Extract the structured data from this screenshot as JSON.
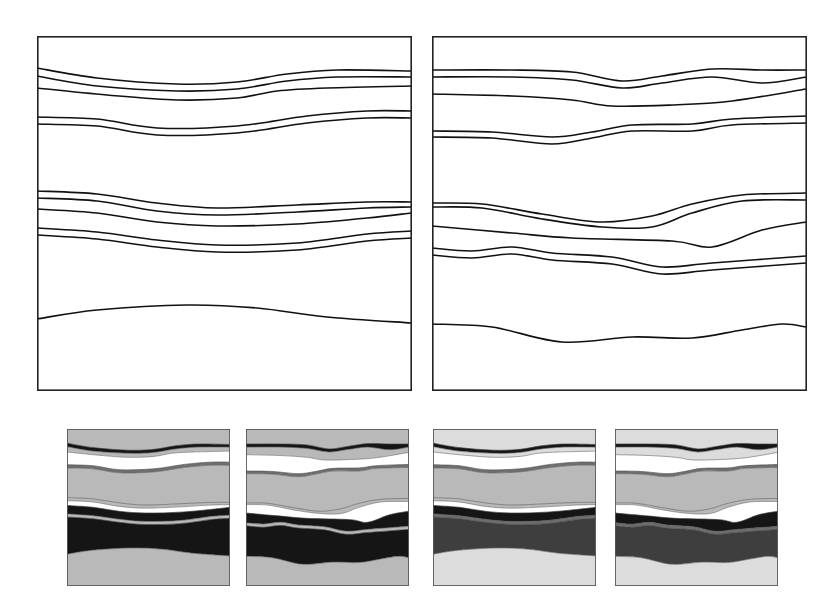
{
  "figure": {
    "colors": {
      "line": "#111111",
      "frame": "#222222",
      "white": "#ffffff",
      "black": "#151515",
      "dark_gray": "#3e3e3e",
      "mid_gray": "#6e6e6e",
      "gray": "#8a8a8a",
      "light_gray": "#b9b9b9",
      "pale_gray": "#dcdcdc"
    },
    "large_panels": [
      {
        "id": "left",
        "width": 374,
        "height": 354,
        "horizons": [
          [
            [
              0,
              32
            ],
            [
              60,
              42
            ],
            [
              140,
              48
            ],
            [
              200,
              46
            ],
            [
              250,
              38
            ],
            [
              300,
              34
            ],
            [
              374,
              35
            ]
          ],
          [
            [
              0,
              40
            ],
            [
              60,
              50
            ],
            [
              140,
              55
            ],
            [
              200,
              53
            ],
            [
              250,
              45
            ],
            [
              300,
              41
            ],
            [
              374,
              41
            ]
          ],
          [
            [
              0,
              52
            ],
            [
              70,
              59
            ],
            [
              140,
              64
            ],
            [
              200,
              62
            ],
            [
              240,
              55
            ],
            [
              290,
              52
            ],
            [
              374,
              50
            ]
          ],
          [
            [
              0,
              81
            ],
            [
              60,
              83
            ],
            [
              120,
              92
            ],
            [
              200,
              90
            ],
            [
              270,
              80
            ],
            [
              330,
              75
            ],
            [
              374,
              75
            ]
          ],
          [
            [
              0,
              88
            ],
            [
              60,
              90
            ],
            [
              120,
              99
            ],
            [
              200,
              97
            ],
            [
              270,
              87
            ],
            [
              330,
              82
            ],
            [
              374,
              82
            ]
          ],
          [
            [
              0,
              155
            ],
            [
              60,
              158
            ],
            [
              120,
              167
            ],
            [
              180,
              172
            ],
            [
              260,
              169
            ],
            [
              330,
              166
            ],
            [
              374,
              166
            ]
          ],
          [
            [
              0,
              162
            ],
            [
              60,
              165
            ],
            [
              120,
              175
            ],
            [
              180,
              179
            ],
            [
              260,
              176
            ],
            [
              330,
              172
            ],
            [
              374,
              171
            ]
          ],
          [
            [
              0,
              173
            ],
            [
              60,
              177
            ],
            [
              120,
              186
            ],
            [
              180,
              190
            ],
            [
              260,
              188
            ],
            [
              330,
              182
            ],
            [
              374,
              177
            ]
          ],
          [
            [
              0,
              192
            ],
            [
              60,
              196
            ],
            [
              120,
              204
            ],
            [
              180,
              209
            ],
            [
              260,
              207
            ],
            [
              330,
              198
            ],
            [
              374,
              195
            ]
          ],
          [
            [
              0,
              199
            ],
            [
              60,
              203
            ],
            [
              120,
              211
            ],
            [
              180,
              216
            ],
            [
              260,
              214
            ],
            [
              330,
              205
            ],
            [
              374,
              202
            ]
          ],
          [
            [
              0,
              283
            ],
            [
              60,
              274
            ],
            [
              150,
              269
            ],
            [
              220,
              272
            ],
            [
              290,
              281
            ],
            [
              374,
              287
            ]
          ]
        ]
      },
      {
        "id": "right",
        "width": 374,
        "height": 354,
        "horizons": [
          [
            [
              0,
              34
            ],
            [
              80,
              34
            ],
            [
              140,
              36
            ],
            [
              190,
              45
            ],
            [
              230,
              40
            ],
            [
              280,
              33
            ],
            [
              330,
              34
            ],
            [
              374,
              34
            ]
          ],
          [
            [
              0,
              41
            ],
            [
              80,
              41
            ],
            [
              140,
              44
            ],
            [
              190,
              52
            ],
            [
              230,
              47
            ],
            [
              280,
              41
            ],
            [
              330,
              47
            ],
            [
              374,
              41
            ]
          ],
          [
            [
              0,
              58
            ],
            [
              80,
              60
            ],
            [
              140,
              64
            ],
            [
              180,
              70
            ],
            [
              240,
              69
            ],
            [
              300,
              65
            ],
            [
              374,
              53
            ]
          ],
          [
            [
              0,
              95
            ],
            [
              60,
              96
            ],
            [
              120,
              101
            ],
            [
              160,
              96
            ],
            [
              200,
              89
            ],
            [
              260,
              88
            ],
            [
              300,
              83
            ],
            [
              374,
              80
            ]
          ],
          [
            [
              0,
              101
            ],
            [
              60,
              102
            ],
            [
              120,
              108
            ],
            [
              160,
              102
            ],
            [
              200,
              95
            ],
            [
              260,
              95
            ],
            [
              300,
              89
            ],
            [
              374,
              87
            ]
          ],
          [
            [
              0,
              167
            ],
            [
              50,
              168
            ],
            [
              110,
              178
            ],
            [
              170,
              186
            ],
            [
              220,
              180
            ],
            [
              260,
              168
            ],
            [
              310,
              159
            ],
            [
              374,
              157
            ]
          ],
          [
            [
              0,
              171
            ],
            [
              50,
              172
            ],
            [
              110,
              183
            ],
            [
              170,
              191
            ],
            [
              220,
              191
            ],
            [
              260,
              177
            ],
            [
              310,
              165
            ],
            [
              374,
              164
            ]
          ],
          [
            [
              0,
              190
            ],
            [
              80,
              197
            ],
            [
              140,
              202
            ],
            [
              240,
              205
            ],
            [
              280,
              211
            ],
            [
              330,
              194
            ],
            [
              374,
              186
            ]
          ],
          [
            [
              0,
              212
            ],
            [
              40,
              215
            ],
            [
              80,
              211
            ],
            [
              120,
              217
            ],
            [
              180,
              221
            ],
            [
              230,
              231
            ],
            [
              280,
              227
            ],
            [
              374,
              220
            ]
          ],
          [
            [
              0,
              219
            ],
            [
              40,
              222
            ],
            [
              80,
              218
            ],
            [
              120,
              224
            ],
            [
              180,
              228
            ],
            [
              230,
              238
            ],
            [
              280,
              234
            ],
            [
              374,
              227
            ]
          ],
          [
            [
              0,
              288
            ],
            [
              60,
              291
            ],
            [
              130,
              306
            ],
            [
              200,
              301
            ],
            [
              260,
              302
            ],
            [
              310,
              294
            ],
            [
              350,
              288
            ],
            [
              374,
              291
            ]
          ]
        ]
      }
    ],
    "small_panels": [
      {
        "id": "small-1",
        "source": "left",
        "fills": [
          "light_gray",
          "black",
          "light_gray",
          "white",
          "mid_gray",
          "light_gray",
          "light_gray",
          "white",
          "black",
          "light_gray",
          "black",
          "light_gray",
          "dark_gray"
        ],
        "stroke": "black"
      },
      {
        "id": "small-2",
        "source": "right",
        "fills": [
          "light_gray",
          "black",
          "light_gray",
          "white",
          "mid_gray",
          "light_gray",
          "light_gray",
          "white",
          "black",
          "light_gray",
          "black",
          "light_gray",
          "dark_gray"
        ],
        "stroke": "black"
      },
      {
        "id": "small-3",
        "source": "left",
        "fills": [
          "pale_gray",
          "black",
          "pale_gray",
          "white",
          "mid_gray",
          "light_gray",
          "light_gray",
          "white",
          "black",
          "mid_gray",
          "dark_gray",
          "pale_gray",
          "gray"
        ],
        "stroke": "black"
      },
      {
        "id": "small-4",
        "source": "right",
        "fills": [
          "pale_gray",
          "black",
          "pale_gray",
          "white",
          "mid_gray",
          "light_gray",
          "light_gray",
          "white",
          "black",
          "mid_gray",
          "dark_gray",
          "pale_gray",
          "gray"
        ],
        "stroke": "black"
      }
    ]
  }
}
